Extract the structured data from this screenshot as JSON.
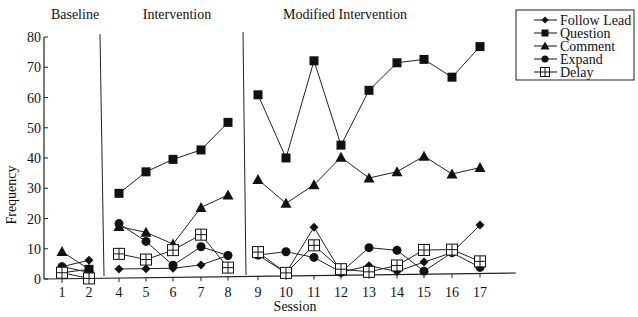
{
  "chart_data": {
    "type": "line",
    "title": "",
    "xlabel": "Session",
    "ylabel": "Frequency",
    "ylim": [
      0,
      80
    ],
    "yticks": [
      0,
      10,
      20,
      30,
      40,
      50,
      60,
      70,
      80
    ],
    "x": [
      1,
      2,
      4,
      5,
      6,
      7,
      8,
      9,
      10,
      11,
      12,
      13,
      14,
      15,
      16,
      17
    ],
    "phases": [
      {
        "label": "Baseline",
        "sessions": [
          1,
          2
        ]
      },
      {
        "label": "Intervention",
        "sessions": [
          4,
          5,
          6,
          7,
          8
        ]
      },
      {
        "label": "Modified Intervention",
        "sessions": [
          9,
          10,
          11,
          12,
          13,
          14,
          15,
          16,
          17
        ]
      }
    ],
    "series": [
      {
        "name": "Follow Lead",
        "marker": "diamond",
        "values": [
          4,
          6,
          3,
          3,
          3,
          4,
          7,
          7,
          1,
          16,
          1,
          3,
          1,
          4,
          7,
          16
        ]
      },
      {
        "name": "Question",
        "marker": "square",
        "values": [
          2,
          3,
          28,
          35,
          39,
          42,
          51,
          60,
          39,
          71,
          43,
          61,
          70,
          71,
          65,
          75
        ]
      },
      {
        "name": "Comment",
        "marker": "triangle",
        "values": [
          9,
          3,
          17,
          15,
          11,
          23,
          27,
          32,
          24,
          30,
          39,
          32,
          34,
          39,
          33,
          35
        ]
      },
      {
        "name": "Expand",
        "marker": "circle",
        "values": [
          4,
          2,
          18,
          12,
          4,
          10,
          7,
          7,
          8,
          6,
          1,
          9,
          8,
          1,
          7,
          2
        ]
      },
      {
        "name": "Delay",
        "marker": "boxplus",
        "values": [
          2,
          0,
          8,
          6,
          9,
          14,
          3,
          8,
          1,
          10,
          2,
          1,
          3,
          8,
          8,
          4
        ]
      }
    ],
    "legend_position": "top-right",
    "grid": false
  }
}
